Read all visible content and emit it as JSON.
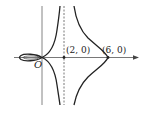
{
  "diagram": {
    "origin_label": "O",
    "point_a_label": "(2, 0)",
    "point_b_label": "(6, 0)",
    "colors": {
      "curve": "#222222",
      "axis": "#555555",
      "background": "#ffffff"
    }
  }
}
